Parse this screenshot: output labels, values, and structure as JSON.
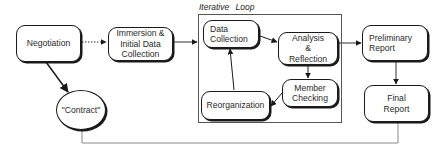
{
  "diagram": {
    "loop": {
      "label": "Iterative  Loop"
    },
    "nodes": {
      "negotiation": "Negotiation",
      "immersion": "Immersion &\nInitial Data\nCollection",
      "data_collection": "Data\nCollection",
      "analysis": "Analysis\n&\nReflection",
      "member_checking": "Member\nChecking",
      "reorganization": "Reorganization",
      "preliminary_report": "Preliminary\nReport",
      "final_report": "Final\nReport",
      "contract": "\"Contract\""
    },
    "edges": [
      {
        "from": "Negotiation",
        "to": "Immersion & Initial Data Collection",
        "style": "dotted"
      },
      {
        "from": "Negotiation",
        "to": "\"Contract\"",
        "style": "solid"
      },
      {
        "from": "Immersion & Initial Data Collection",
        "to": "Iterative Loop",
        "style": "solid"
      },
      {
        "from": "Data Collection",
        "to": "Analysis & Reflection",
        "style": "solid"
      },
      {
        "from": "Analysis & Reflection",
        "to": "Member Checking",
        "style": "solid"
      },
      {
        "from": "Member Checking",
        "to": "Reorganization",
        "style": "solid"
      },
      {
        "from": "Reorganization",
        "to": "Data Collection",
        "style": "solid"
      },
      {
        "from": "Iterative Loop",
        "to": "Preliminary Report",
        "style": "solid"
      },
      {
        "from": "Preliminary Report",
        "to": "Final Report",
        "style": "solid"
      },
      {
        "from": "\"Contract\"",
        "to": "Final Report",
        "style": "thin-line"
      }
    ],
    "colors": {
      "stroke": "#1a1a1a",
      "text": "#2a2a2a",
      "background": "#ffffff",
      "feedback_line": "#888888"
    }
  }
}
